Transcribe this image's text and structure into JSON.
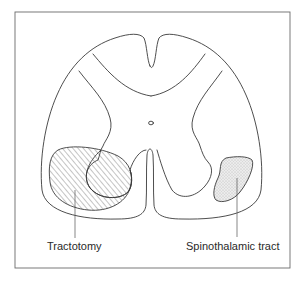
{
  "diagram": {
    "labels": {
      "tractotomy": "Tractotomy",
      "spinothalamic": "Spinothalamic tract"
    },
    "regions": [
      {
        "name": "tractotomy-lesion",
        "fill": "hatched"
      },
      {
        "name": "spinothalamic-tract",
        "fill": "stippled"
      }
    ],
    "colors": {
      "stroke": "#3a3a3a",
      "frame": "#6a6a6a",
      "stipple": "#e6e6e6",
      "background": "#ffffff"
    }
  }
}
